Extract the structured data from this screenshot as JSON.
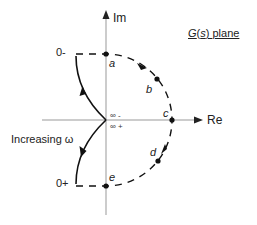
{
  "diagram": {
    "title": {
      "func": "G",
      "var": "s",
      "suffix": "plane",
      "full": "G(s) plane"
    },
    "axes": {
      "imaginary_label": "Im",
      "real_label": "Re"
    },
    "points": {
      "a": "a",
      "b": "b",
      "c": "c",
      "d": "d",
      "e": "e"
    },
    "frequency_labels": {
      "zero_minus": "0-",
      "zero_plus": "0+",
      "inf_minus": "∞ -",
      "inf_plus": "∞ +"
    },
    "annotation": "Increasing ω",
    "colors": {
      "curve": "#111111",
      "axis": "#999999",
      "text": "#222222"
    }
  }
}
